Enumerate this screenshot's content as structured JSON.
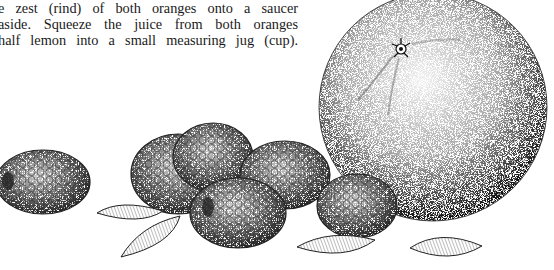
{
  "page": {
    "text_lines": [
      "zest of both oranges and juice. Finely",
      "e zest (rind) of both oranges onto a saucer",
      "aside. Squeeze the juice from both oranges",
      "half lemon into a small measuring jug (cup)."
    ]
  },
  "illustration": {
    "subject": "Stippled pen-and-ink drawing of an orange, raspberries and almonds",
    "items": [
      {
        "name": "orange",
        "count": 1
      },
      {
        "name": "raspberry",
        "count": 5
      },
      {
        "name": "almond",
        "count": 4
      }
    ],
    "colors": {
      "ink": "#1a1a1a",
      "paper": "#ffffff"
    }
  }
}
